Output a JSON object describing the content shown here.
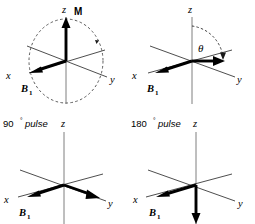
{
  "figure": {
    "background_color": "#ffffff",
    "axis_color": "#3a3a3a",
    "vector_color": "#000000",
    "dashed_color": "#4a4a4a"
  },
  "panels": [
    {
      "id": "panel-a",
      "position": "top-left",
      "axes": {
        "z_label": "z",
        "x_label": "x",
        "y_label": "y"
      },
      "vectors": [
        {
          "name": "M",
          "label": "M",
          "direction": "+z",
          "style": "thick-solid"
        },
        {
          "name": "B1",
          "label": "B",
          "subscript": "1",
          "direction": "-x",
          "style": "thick-solid"
        }
      ],
      "annotations": {
        "dashed_circle": "precession-circle",
        "rotation_arrowhead": "clockwise"
      }
    },
    {
      "id": "panel-b",
      "position": "top-right",
      "axes": {
        "z_label": "z",
        "x_label": "x",
        "y_label": "y"
      },
      "vectors": [
        {
          "name": "M",
          "label": "",
          "direction": "tipped-toward-y",
          "style": "thick-solid"
        },
        {
          "name": "B1",
          "label": "B",
          "subscript": "1",
          "direction": "-x",
          "style": "thick-solid"
        }
      ],
      "annotations": {
        "angle_label": "θ",
        "dashed_arc": "tip-angle-arc"
      }
    },
    {
      "id": "panel-c",
      "position": "bottom-left",
      "caption": {
        "value": "90",
        "degree": "°",
        "word": "pulse",
        "full": "90° pulse"
      },
      "axes": {
        "z_label": "z",
        "x_label": "x",
        "y_label": "y"
      },
      "vectors": [
        {
          "name": "M",
          "label": "",
          "direction": "+y",
          "style": "thick-solid"
        },
        {
          "name": "B1",
          "label": "B",
          "subscript": "1",
          "direction": "-x",
          "style": "thick-solid"
        }
      ]
    },
    {
      "id": "panel-d",
      "position": "bottom-right",
      "caption": {
        "value": "180",
        "degree": "°",
        "word": "pulse",
        "full": "180° pulse"
      },
      "axes": {
        "z_label": "z",
        "x_label": "x",
        "y_label": "y"
      },
      "vectors": [
        {
          "name": "M",
          "label": "",
          "direction": "-z",
          "style": "thick-solid"
        },
        {
          "name": "B1",
          "label": "B",
          "subscript": "1",
          "direction": "-x",
          "style": "thick-solid"
        }
      ]
    }
  ]
}
